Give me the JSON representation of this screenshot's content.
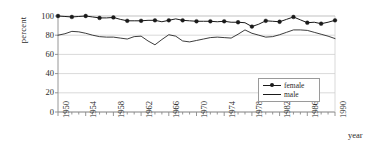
{
  "chart_data": {
    "type": "line",
    "title": "",
    "xlabel": "year",
    "ylabel": "percent",
    "ylim": [
      0,
      100
    ],
    "xlim": [
      1950,
      1990
    ],
    "ytick_labels": [
      "0",
      "20",
      "40",
      "60",
      "80",
      "100"
    ],
    "ytick_values": [
      0,
      20,
      40,
      60,
      80,
      100
    ],
    "xtick_labels": [
      "1950",
      "1954",
      "1958",
      "1962",
      "1966",
      "1970",
      "1974",
      "1978",
      "1982",
      "1986",
      "1990"
    ],
    "xtick_values": [
      1950,
      1954,
      1958,
      1962,
      1966,
      1970,
      1974,
      1978,
      1982,
      1986,
      1990
    ],
    "minor_xticks_every": 1,
    "grid": "horizontal",
    "legend_position": "inside-right",
    "x": [
      1950,
      1951,
      1952,
      1953,
      1954,
      1955,
      1956,
      1957,
      1958,
      1959,
      1960,
      1961,
      1962,
      1963,
      1964,
      1965,
      1966,
      1967,
      1968,
      1969,
      1970,
      1971,
      1972,
      1973,
      1974,
      1975,
      1976,
      1977,
      1978,
      1979,
      1980,
      1981,
      1982,
      1983,
      1984,
      1985,
      1986,
      1987,
      1988,
      1989,
      1990
    ],
    "series": [
      {
        "name": "female",
        "marker": "filled-circle",
        "marker_every": 2,
        "values": [
          100,
          99.5,
          99,
          99.5,
          100,
          99,
          98,
          98,
          98.5,
          96.5,
          95,
          95,
          95,
          95.5,
          95.5,
          94,
          95.5,
          97,
          95.5,
          95,
          94.5,
          94.5,
          94.5,
          94,
          94.5,
          93.5,
          93.5,
          93,
          89,
          91.5,
          95,
          94.5,
          94,
          96.5,
          99,
          96,
          93,
          93.5,
          92,
          93.5,
          95.5
        ]
      },
      {
        "name": "male",
        "marker": "none",
        "values": [
          80,
          81.5,
          84,
          83.5,
          82,
          80,
          78.5,
          78,
          78,
          77,
          76,
          78.5,
          79,
          74,
          70,
          75.5,
          80.5,
          79,
          74,
          73,
          74.5,
          76,
          77.5,
          78,
          77.5,
          77,
          81,
          85.5,
          82,
          80,
          78,
          78.5,
          80.5,
          83,
          85.5,
          85.5,
          85,
          83,
          81,
          79,
          76.5
        ]
      }
    ]
  },
  "legend": {
    "items": [
      {
        "label": "female",
        "style": "line-with-marker"
      },
      {
        "label": "male",
        "style": "line"
      }
    ]
  },
  "colors": {
    "series_line": "#1a1a1a",
    "grid": "#cfcfcf",
    "axis": "#8a8a8a",
    "text": "#2b2b2b",
    "background": "#ffffff"
  }
}
